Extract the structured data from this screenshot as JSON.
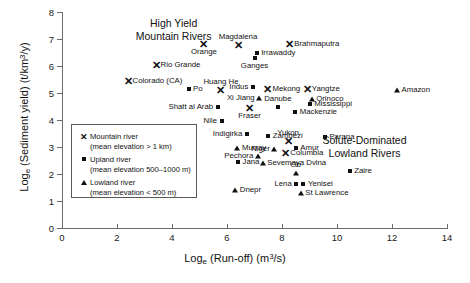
{
  "chart_data": {
    "type": "scatter",
    "title": "",
    "xlabel": "Log_e (Run-off) (m3/s)",
    "ylabel": "Log_e (Sediment yield) (t/km3/y)",
    "xlim": [
      0,
      14
    ],
    "ylim": [
      0,
      8
    ],
    "xticks": [
      0,
      2,
      4,
      6,
      8,
      10,
      12,
      14
    ],
    "yticks": [
      0,
      1,
      2,
      3,
      4,
      5,
      6,
      7,
      8
    ],
    "grid": false,
    "legend_position": "inside-left",
    "series": [
      {
        "name": "Mountain river",
        "marker": "x",
        "description": "mean elevation > 1 km",
        "points": [
          {
            "label": "Rio Grande",
            "x": 3.42,
            "y": 6.02,
            "lpos": "right"
          },
          {
            "label": "Colorado (CA)",
            "x": 2.4,
            "y": 5.46,
            "lpos": "right"
          },
          {
            "label": "Orange",
            "x": 5.16,
            "y": 6.8,
            "lpos": "below"
          },
          {
            "label": "Magdalena",
            "x": 6.4,
            "y": 6.76,
            "lpos": "above"
          },
          {
            "label": "Brahmaputra",
            "x": 8.28,
            "y": 6.83,
            "lpos": "right"
          },
          {
            "label": "Huang He",
            "x": 5.78,
            "y": 5.12,
            "lpos": "above"
          },
          {
            "label": "Mekong",
            "x": 7.49,
            "y": 5.15,
            "lpos": "right"
          },
          {
            "label": "Yangtze",
            "x": 8.92,
            "y": 5.15,
            "lpos": "right"
          },
          {
            "label": "Fraser",
            "x": 6.82,
            "y": 4.46,
            "lpos": "below"
          },
          {
            "label": "Yukon",
            "x": 8.22,
            "y": 3.22,
            "lpos": "above"
          },
          {
            "label": "Columbia",
            "x": 8.14,
            "y": 2.76,
            "lpos": "right"
          }
        ]
      },
      {
        "name": "Upland river",
        "marker": "square",
        "description": "mean elevation 500–1000 m",
        "points": [
          {
            "label": "Irrawaddy",
            "x": 7.08,
            "y": 6.48,
            "lpos": "right"
          },
          {
            "label": "Ganges",
            "x": 7.0,
            "y": 6.3,
            "lpos": "below"
          },
          {
            "label": "Po",
            "x": 4.6,
            "y": 5.13,
            "lpos": "right"
          },
          {
            "label": "Indus",
            "x": 6.94,
            "y": 5.22,
            "lpos": "left"
          },
          {
            "label": "Shatt al Arab",
            "x": 5.66,
            "y": 4.5,
            "lpos": "left"
          },
          {
            "label": "Nile",
            "x": 5.8,
            "y": 3.96,
            "lpos": "left"
          },
          {
            "label": "Mississippi",
            "x": 9.01,
            "y": 4.58,
            "lpos": "right"
          },
          {
            "label": "Mackenzie",
            "x": 8.48,
            "y": 4.28,
            "lpos": "right"
          },
          {
            "label": "Danube",
            "x": 7.85,
            "y": 4.48,
            "lpos": "above"
          },
          {
            "label": "Indigirka",
            "x": 6.72,
            "y": 3.48,
            "lpos": "left"
          },
          {
            "label": "Zambezi",
            "x": 7.5,
            "y": 3.4,
            "lpos": "right"
          },
          {
            "label": "Parana",
            "x": 9.56,
            "y": 3.38,
            "lpos": "right"
          },
          {
            "label": "Amur",
            "x": 8.5,
            "y": 2.98,
            "lpos": "right"
          },
          {
            "label": "Jana",
            "x": 6.4,
            "y": 2.44,
            "lpos": "right"
          },
          {
            "label": "Zaire",
            "x": 10.46,
            "y": 2.1,
            "lpos": "right"
          },
          {
            "label": "Lena",
            "x": 8.52,
            "y": 1.62,
            "lpos": "left"
          },
          {
            "label": "Yenisei",
            "x": 8.78,
            "y": 1.62,
            "lpos": "right"
          }
        ]
      },
      {
        "name": "Lowland river",
        "marker": "triangle",
        "description": "mean elevation < 500 m",
        "points": [
          {
            "label": "Xi Jiang",
            "x": 7.17,
            "y": 4.82,
            "lpos": "left"
          },
          {
            "label": "Orinoco",
            "x": 9.08,
            "y": 4.78,
            "lpos": "right"
          },
          {
            "label": "Amazon",
            "x": 12.18,
            "y": 5.12,
            "lpos": "right"
          },
          {
            "label": "Murray",
            "x": 6.38,
            "y": 2.96,
            "lpos": "right"
          },
          {
            "label": "Niger",
            "x": 7.72,
            "y": 2.94,
            "lpos": "left"
          },
          {
            "label": "Pechora",
            "x": 7.12,
            "y": 2.66,
            "lpos": "left"
          },
          {
            "label": "Sevemaya Dvina",
            "x": 7.3,
            "y": 2.4,
            "lpos": "right"
          },
          {
            "label": "Ob",
            "x": 8.5,
            "y": 2.02,
            "lpos": "above"
          },
          {
            "label": "St Lawrence",
            "x": 8.68,
            "y": 1.3,
            "lpos": "right"
          },
          {
            "label": "Dnepr",
            "x": 6.3,
            "y": 1.42,
            "lpos": "right"
          }
        ]
      }
    ],
    "annotations": [
      {
        "name": "high-yield-mountain-rivers",
        "line1": "High Yield",
        "line2": "Mountain Rivers",
        "x": 4.06,
        "y": 7.33
      },
      {
        "name": "solute-dominated-lowland-rivers",
        "line1": "Solute-Dominated",
        "line2": "Lowland Rivers",
        "x": 11.0,
        "y": 3.0
      }
    ]
  },
  "axes": {
    "x_title_prefix": "Log",
    "x_title_sub": "e",
    "x_title_mid": " (Run-off) (m",
    "x_title_sup": "3",
    "x_title_suffix": "/s)",
    "y_title_prefix": "Log",
    "y_title_sub": "e",
    "y_title_mid": " (Sediment yield) (t/km",
    "y_title_sup": "3",
    "y_title_suffix": "/y)"
  },
  "legend": {
    "items": [
      {
        "symbol": "x-marker-icon",
        "title": "Mountain river",
        "subtitle": "(mean elevation > 1 km)"
      },
      {
        "symbol": "square-marker-icon",
        "title": "Upland river",
        "subtitle": "(mean elevation 500–1000 m)"
      },
      {
        "symbol": "triangle-marker-icon",
        "title": "Lowland river",
        "subtitle": "(mean elevation < 500 m)"
      }
    ]
  }
}
